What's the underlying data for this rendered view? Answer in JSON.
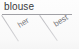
{
  "diagram": {
    "type": "dependency-tree-fragment",
    "head": {
      "text": "blouse"
    },
    "baseline": {
      "present": true
    },
    "branches": [
      {
        "id": "left",
        "label": "her",
        "direction": "down-right",
        "rotation_deg": -32
      },
      {
        "id": "right",
        "label": "best",
        "direction": "down-right",
        "rotation_deg": -32
      }
    ],
    "colors": {
      "text": "#26262a",
      "line": "#8a8a90",
      "branch_line": "#a8a8ae",
      "background": "#fdfdfd"
    }
  }
}
